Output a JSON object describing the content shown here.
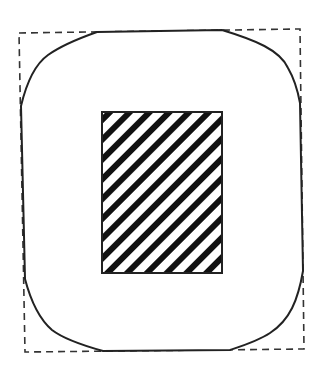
{
  "diagram": {
    "colors": {
      "background": "#ffffff",
      "stroke": "#222222",
      "hatch": "#111111"
    },
    "dashed_bounding_box": {
      "corners": [
        [
          19,
          33
        ],
        [
          300,
          29
        ],
        [
          304,
          349
        ],
        [
          25,
          352
        ]
      ]
    },
    "rounded_outline": {
      "top_edge": [
        [
          97,
          32
        ],
        [
          222,
          30
        ]
      ],
      "right_edge": [
        [
          300,
          103
        ],
        [
          303,
          271
        ]
      ],
      "bottom_edge": [
        [
          230,
          350
        ],
        [
          103,
          351
        ]
      ],
      "left_edge": [
        [
          25,
          279
        ],
        [
          21,
          106
        ]
      ]
    },
    "hatched_rectangle": {
      "x": 102,
      "y": 112,
      "width": 120,
      "height": 161,
      "hatch_angle_deg": 45,
      "stripe_width": 6,
      "stripe_period": 14
    }
  }
}
